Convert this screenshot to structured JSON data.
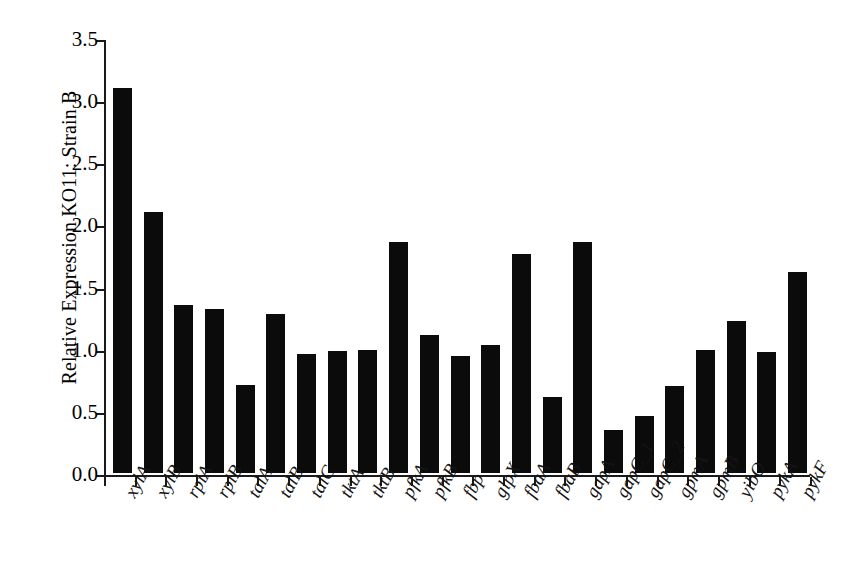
{
  "chart_data": {
    "type": "bar",
    "title": "",
    "xlabel": "",
    "ylabel": "Relative Expression KO11: Strain B",
    "ylim": [
      0.0,
      3.5
    ],
    "ytick_labels": [
      "0.0",
      "0.5",
      "1.0",
      "1.5",
      "2.0",
      "2.5",
      "3.0",
      "3.5"
    ],
    "ytick_values": [
      0.0,
      0.5,
      1.0,
      1.5,
      2.0,
      2.5,
      3.0,
      3.5
    ],
    "grid": false,
    "legend": "none",
    "bar_color": "#0b0b0b",
    "axis_color": "#1a1a1a",
    "categories": [
      "xylA",
      "xylB",
      "rpiA",
      "rpiB",
      "talA",
      "talB",
      "talC",
      "tktA",
      "tktB",
      "pfkA",
      "pfkB",
      "fbp",
      "glpX",
      "fbaA",
      "fbaB",
      "gapA",
      "gapC_1",
      "gapC_2",
      "gpmA",
      "gpmB",
      "yibO",
      "pykA",
      "pykF"
    ],
    "values": [
      3.1,
      2.1,
      1.35,
      1.32,
      0.71,
      1.28,
      0.96,
      0.98,
      0.99,
      1.86,
      1.11,
      0.94,
      1.03,
      1.76,
      0.61,
      1.86,
      0.35,
      0.46,
      0.7,
      0.99,
      1.22,
      0.97,
      1.62
    ]
  }
}
